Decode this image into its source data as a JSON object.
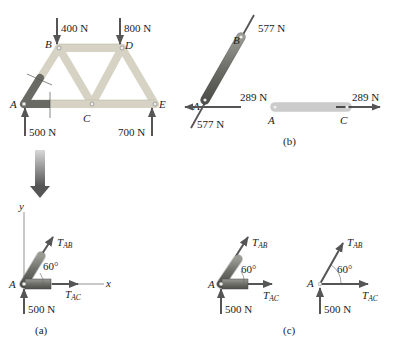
{
  "truss": {
    "joints": {
      "A": "A",
      "B": "B",
      "C": "C",
      "D": "D",
      "E": "E"
    },
    "loads": {
      "B": "400 N",
      "D": "800 N"
    },
    "reactions": {
      "A": "500 N",
      "E": "700 N"
    }
  },
  "panel_b": {
    "member_ab": {
      "end_top": "B",
      "end_bottom": "A",
      "force_top": "577 N",
      "force_bottom": "577 N"
    },
    "member_ac": {
      "end_left": "A",
      "end_right": "C",
      "force_left": "289 N",
      "force_right": "289 N"
    },
    "caption": "(b)"
  },
  "panel_a": {
    "axis_y": "y",
    "axis_x": "x",
    "joint": "A",
    "t_ab": "T",
    "t_ab_sub": "AB",
    "t_ac": "T",
    "t_ac_sub": "AC",
    "angle": "60°",
    "reaction": "500 N",
    "caption": "(a)"
  },
  "panel_c": {
    "left": {
      "joint": "A",
      "t_ab": "T",
      "t_ab_sub": "AB",
      "t_ac": "T",
      "t_ac_sub": "AC",
      "angle": "60°",
      "reaction": "500 N"
    },
    "right": {
      "joint": "A",
      "t_ab": "T",
      "t_ab_sub": "AB",
      "t_ac": "T",
      "t_ac_sub": "AC",
      "angle": "60°",
      "reaction": "500 N"
    },
    "caption": "(c)"
  },
  "colors": {
    "member_light": "#d9d6c8",
    "member_dark": "#6b6b66",
    "arrow": "#5a5a5a",
    "big_arrow_top": "#c8c8c8",
    "big_arrow_bottom": "#555555"
  }
}
